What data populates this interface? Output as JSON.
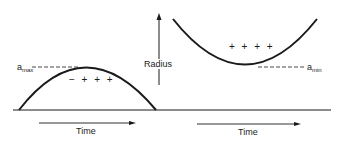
{
  "diagram": {
    "vertical_axis": {
      "label": "Radius"
    },
    "left_panel": {
      "curve": "arch (concave down)",
      "max_label": {
        "base": "a",
        "sub": "max"
      },
      "charges": "− + + +",
      "time_label": "Time"
    },
    "right_panel": {
      "curve": "bowl (concave up)",
      "min_label": {
        "base": "a",
        "sub": "min"
      },
      "charges": "+ + + +",
      "time_label": "Time"
    },
    "colors": {
      "ink": "#1a1a1a",
      "background": "#ffffff"
    }
  }
}
